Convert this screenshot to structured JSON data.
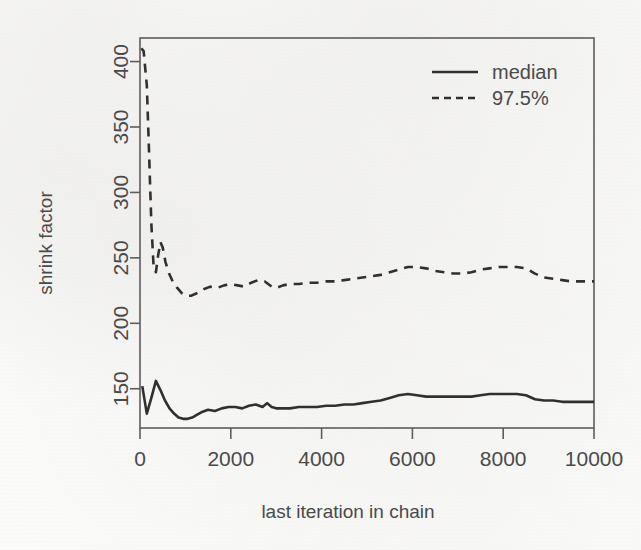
{
  "page": {
    "background_color": "#fbfbfa",
    "ink_color": "#303030",
    "axis_color": "#5d5d5d"
  },
  "chart_data": {
    "type": "line",
    "title": "",
    "subtitle": "",
    "xlabel": "last iteration in chain",
    "ylabel": "shrink factor",
    "xlim": [
      0,
      10000
    ],
    "ylim": [
      120,
      418
    ],
    "xticks": [
      0,
      2000,
      4000,
      6000,
      8000,
      10000
    ],
    "xtick_labels": [
      "0",
      "2000",
      "4000",
      "6000",
      "8000",
      "10000"
    ],
    "yticks": [
      150,
      200,
      250,
      300,
      350,
      400
    ],
    "ytick_labels": [
      "150",
      "200",
      "250",
      "300",
      "350",
      "400"
    ],
    "grid": false,
    "legend_position": "top-right",
    "legend": [
      {
        "label": "median",
        "style": "solid"
      },
      {
        "label": "97.5%",
        "style": "dashed"
      }
    ],
    "series": [
      {
        "name": "median",
        "style": "solid",
        "x": [
          50,
          150,
          250,
          350,
          450,
          550,
          650,
          750,
          850,
          950,
          1050,
          1150,
          1250,
          1350,
          1500,
          1650,
          1800,
          1950,
          2100,
          2250,
          2400,
          2550,
          2700,
          2800,
          2900,
          3000,
          3150,
          3300,
          3500,
          3700,
          3900,
          4100,
          4300,
          4500,
          4700,
          4900,
          5100,
          5300,
          5500,
          5700,
          5900,
          6100,
          6300,
          6500,
          6700,
          6900,
          7100,
          7300,
          7500,
          7700,
          7900,
          8100,
          8300,
          8500,
          8700,
          8900,
          9100,
          9300,
          9500,
          9700,
          9900,
          10000
        ],
        "y": [
          152,
          131,
          143,
          156,
          149,
          141,
          135,
          131,
          128,
          127,
          127,
          128,
          130,
          132,
          134,
          133,
          135,
          136,
          136,
          135,
          137,
          138,
          136,
          139,
          136,
          135,
          135,
          135,
          136,
          136,
          136,
          137,
          137,
          138,
          138,
          139,
          140,
          141,
          143,
          145,
          146,
          145,
          144,
          144,
          144,
          144,
          144,
          144,
          145,
          146,
          146,
          146,
          146,
          145,
          142,
          141,
          141,
          140,
          140,
          140,
          140,
          140
        ]
      },
      {
        "name": "97.5%",
        "style": "dashed",
        "x": [
          30,
          80,
          150,
          200,
          250,
          300,
          350,
          400,
          450,
          500,
          560,
          640,
          720,
          820,
          920,
          1020,
          1120,
          1250,
          1400,
          1550,
          1700,
          1850,
          2000,
          2150,
          2300,
          2450,
          2600,
          2750,
          2900,
          3000,
          3150,
          3300,
          3500,
          3700,
          3900,
          4100,
          4300,
          4500,
          4700,
          4900,
          5100,
          5300,
          5500,
          5700,
          5900,
          6100,
          6300,
          6500,
          6700,
          6900,
          7100,
          7300,
          7500,
          7700,
          7900,
          8100,
          8300,
          8500,
          8700,
          8900,
          9100,
          9300,
          9500,
          9700,
          9900,
          10000
        ],
        "y": [
          410,
          408,
          382,
          330,
          276,
          243,
          239,
          252,
          262,
          258,
          247,
          238,
          232,
          227,
          223,
          221,
          221,
          223,
          226,
          228,
          227,
          229,
          230,
          229,
          228,
          231,
          233,
          232,
          228,
          227,
          229,
          230,
          230,
          231,
          231,
          232,
          232,
          233,
          234,
          235,
          236,
          237,
          239,
          241,
          243,
          243,
          242,
          240,
          239,
          238,
          238,
          239,
          241,
          242,
          243,
          243,
          243,
          242,
          238,
          235,
          234,
          233,
          232,
          232,
          232,
          232
        ]
      }
    ]
  }
}
